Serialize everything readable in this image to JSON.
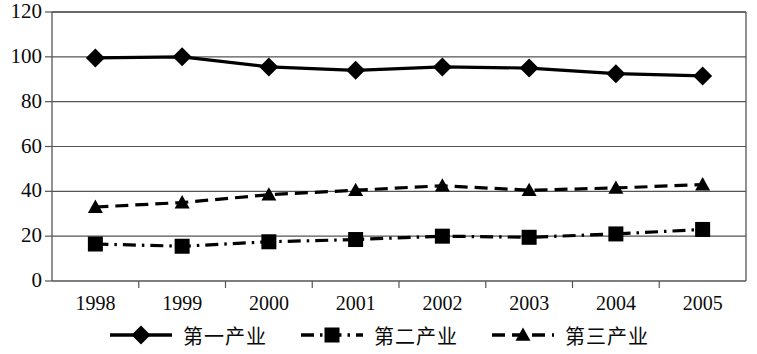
{
  "chart_data": {
    "type": "line",
    "title": "",
    "subtitle": "",
    "xlabel": "",
    "ylabel": "",
    "categories": [
      "1998",
      "1999",
      "2000",
      "2001",
      "2002",
      "2003",
      "2004",
      "2005"
    ],
    "x": [
      1998,
      1999,
      2000,
      2001,
      2002,
      2003,
      2004,
      2005
    ],
    "ylim": [
      0,
      120
    ],
    "yticks": [
      0,
      20,
      40,
      60,
      80,
      100,
      120
    ],
    "ytick_labels": [
      "0",
      "20",
      "40",
      "60",
      "80",
      "100",
      "120"
    ],
    "grid": "horizontal",
    "legend_position": "bottom",
    "series": [
      {
        "name": "第一产业",
        "marker": "diamond",
        "line_style": "solid",
        "color": "#000000",
        "values": [
          99.5,
          100.0,
          95.5,
          94.0,
          95.5,
          95.0,
          92.5,
          91.5
        ]
      },
      {
        "name": "第二产业",
        "marker": "square",
        "line_style": "dash-dot",
        "color": "#000000",
        "values": [
          16.5,
          15.5,
          17.5,
          18.5,
          20.0,
          19.5,
          21.0,
          23.0
        ]
      },
      {
        "name": "第三产业",
        "marker": "triangle",
        "line_style": "dashed",
        "color": "#000000",
        "values": [
          33.0,
          35.0,
          38.5,
          40.5,
          42.5,
          40.5,
          41.5,
          43.0
        ]
      }
    ]
  },
  "legend": {
    "entries": [
      {
        "label": "第一产业",
        "marker": "diamond-marker-icon",
        "line_style": "solid"
      },
      {
        "label": "第二产业",
        "marker": "square-marker-icon",
        "line_style": "dash-dot"
      },
      {
        "label": "第三产业",
        "marker": "triangle-marker-icon",
        "line_style": "dashed"
      }
    ]
  }
}
